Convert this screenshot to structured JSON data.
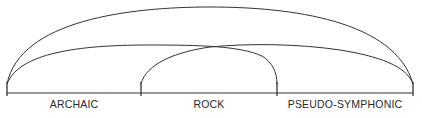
{
  "diagram": {
    "type": "arc-timeline",
    "segments": [
      {
        "label": "ARCHAIC",
        "start_x": 7,
        "end_x": 141
      },
      {
        "label": "ROCK",
        "start_x": 141,
        "end_x": 277
      },
      {
        "label": "PSEUDO-SYMPHONIC",
        "start_x": 277,
        "end_x": 413
      }
    ],
    "arcs": [
      {
        "from": "start of ARCHAIC",
        "to": "end of PSEUDO-SYMPHONIC"
      },
      {
        "from": "start of ARCHAIC",
        "to": "end of ROCK"
      },
      {
        "from": "start of ROCK",
        "to": "end of PSEUDO-SYMPHONIC"
      }
    ],
    "colors": {
      "line": "#333333",
      "background": "#ffffff"
    }
  }
}
